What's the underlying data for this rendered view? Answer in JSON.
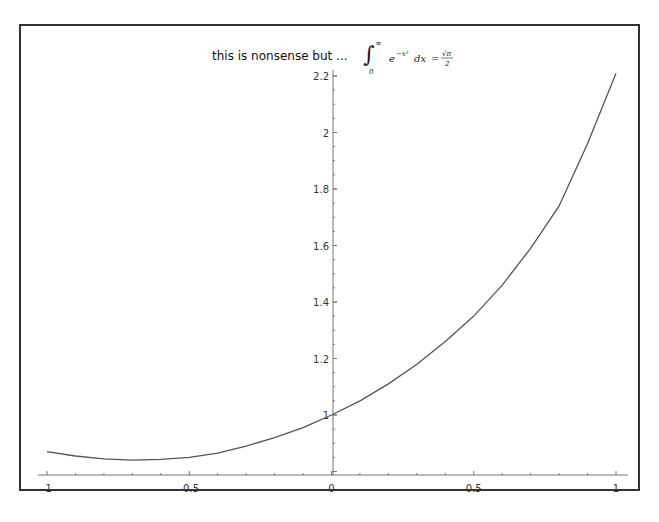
{
  "chart_data": {
    "type": "line",
    "title": "this is nonsense but ...",
    "title_math": "∫₀^∞ e^(−x²) dx = √π / 2",
    "xlabel": "",
    "ylabel": "",
    "xlim": [
      -1,
      1
    ],
    "ylim": [
      0.79,
      2.22
    ],
    "grid": false,
    "x_ticks": [
      "-1",
      "-0.5",
      "0",
      "0.5",
      "1"
    ],
    "y_ticks": [
      "1",
      "1.2",
      "1.4",
      "1.6",
      "1.8",
      "2",
      "2.2"
    ],
    "series": [
      {
        "name": "curve",
        "color": "#555555",
        "x": [
          -1,
          -0.9,
          -0.8,
          -0.7,
          -0.6,
          -0.5,
          -0.4,
          -0.3,
          -0.2,
          -0.1,
          0,
          0.1,
          0.2,
          0.3,
          0.4,
          0.5,
          0.6,
          0.7,
          0.8,
          0.9,
          1
        ],
        "y": [
          0.87,
          0.855,
          0.845,
          0.84,
          0.843,
          0.85,
          0.865,
          0.89,
          0.92,
          0.955,
          1.0,
          1.05,
          1.11,
          1.18,
          1.26,
          1.35,
          1.46,
          1.59,
          1.74,
          1.96,
          2.21
        ]
      }
    ]
  }
}
